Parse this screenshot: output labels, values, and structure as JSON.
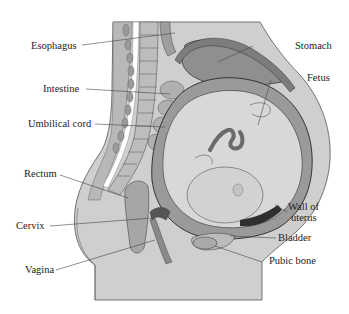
{
  "diagram": {
    "labels": {
      "esophagus": "Esophagus",
      "intestine": "Intestine",
      "umbilical_cord": "Umbilical cord",
      "rectum": "Rectum",
      "cervix": "Cervix",
      "vagina": "Vagina",
      "stomach": "Stomach",
      "fetus": "Fetus",
      "wall_of_uterus_line1": "Wall of",
      "wall_of_uterus_line2": "uterus",
      "bladder": "Bladder",
      "pubic_bone": "Pubic bone"
    },
    "colors": {
      "body_fill": "#c8c8c8",
      "tissue_light": "#d9d9d9",
      "tissue_mid": "#a9a9a9",
      "tissue_dark": "#6e6e6e",
      "outline": "#3a3a3a",
      "leader_line": "#444444"
    }
  }
}
